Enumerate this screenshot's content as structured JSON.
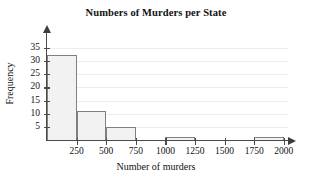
{
  "chart_data": {
    "type": "bar",
    "title": "Numbers of Murders per State",
    "xlabel": "Number of murders",
    "ylabel": "Frequency",
    "categories": [
      "0-250",
      "250-500",
      "500-750",
      "750-1000",
      "1000-1250",
      "1250-1500",
      "1500-1750",
      "1750-2000"
    ],
    "bin_edges": [
      0,
      250,
      500,
      750,
      1000,
      1250,
      1500,
      1750,
      2000
    ],
    "values": [
      32,
      11,
      5,
      0,
      1,
      0,
      0,
      1
    ],
    "bars": [
      {
        "label": "0-250",
        "start": 0,
        "end": 250,
        "value": 32
      },
      {
        "label": "250-500",
        "start": 250,
        "end": 500,
        "value": 11
      },
      {
        "label": "500-750",
        "start": 500,
        "end": 750,
        "value": 5
      },
      {
        "label": "750-1000",
        "start": 750,
        "end": 1000,
        "value": 0
      },
      {
        "label": "1000-1250",
        "start": 1000,
        "end": 1250,
        "value": 1
      },
      {
        "label": "1250-1500",
        "start": 1250,
        "end": 1500,
        "value": 0
      },
      {
        "label": "1500-1750",
        "start": 1500,
        "end": 1750,
        "value": 0
      },
      {
        "label": "1750-2000",
        "start": 1750,
        "end": 2000,
        "value": 1
      }
    ],
    "xticks": [
      250,
      500,
      750,
      1000,
      1250,
      1500,
      1750,
      2000
    ],
    "xtick_labels": [
      "250",
      "500",
      "750",
      "1000",
      "1250",
      "1500",
      "1750",
      "2000"
    ],
    "yticks": [
      5,
      10,
      15,
      20,
      25,
      30,
      35
    ],
    "ytick_labels": [
      "5",
      "10",
      "15",
      "20",
      "25",
      "30",
      "35"
    ],
    "xlim": [
      0,
      2000
    ],
    "ylim": [
      0,
      35
    ],
    "grid": true,
    "legend": null,
    "bar_fill_color": "#f2f2f2",
    "bar_edge_color": "#808080",
    "axis_color": "#4a4a4a",
    "grid_color": "#ededed"
  }
}
